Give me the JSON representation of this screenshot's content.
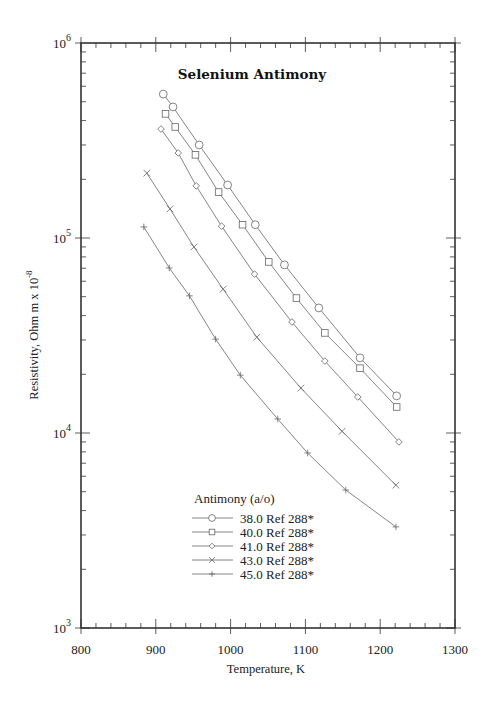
{
  "chart_data": {
    "type": "line",
    "title": "Selenium Antimony",
    "xlabel": "Temperature,  K",
    "ylabel": "Resistivity, Ohm m x 10",
    "ylabel_exponent": "-8",
    "xlim": [
      800,
      1300
    ],
    "ylim": [
      1000,
      1000000
    ],
    "yscale": "log",
    "x_ticks": [
      800,
      900,
      1000,
      1100,
      1200,
      1300
    ],
    "y_ticks": [
      {
        "base": "10",
        "exp": "3",
        "value": 1000
      },
      {
        "base": "10",
        "exp": "4",
        "value": 10000
      },
      {
        "base": "10",
        "exp": "5",
        "value": 100000
      },
      {
        "base": "10",
        "exp": "6",
        "value": 1000000
      }
    ],
    "grid": false,
    "legend_position": "lower-center",
    "legend_title": "Antimony (a/o)",
    "series": [
      {
        "name": "38.0 Ref 288*",
        "marker": "circle",
        "x": [
          910,
          923,
          958,
          996,
          1033,
          1072,
          1118,
          1173,
          1222
        ],
        "y": [
          547000,
          470000,
          300000,
          187000,
          117000,
          72800,
          43800,
          24300,
          15500
        ]
      },
      {
        "name": "40.0 Ref 288*",
        "marker": "square",
        "x": [
          913,
          926,
          953,
          984,
          1016,
          1051,
          1088,
          1126,
          1173,
          1222
        ],
        "y": [
          433000,
          371000,
          267000,
          172000,
          117000,
          75400,
          49200,
          32600,
          21500,
          13600
        ]
      },
      {
        "name": "41.0 Ref 288*",
        "marker": "diamond",
        "x": [
          907,
          930,
          954,
          988,
          1032,
          1082,
          1126,
          1170,
          1225
        ],
        "y": [
          362000,
          273000,
          185000,
          115000,
          65300,
          37100,
          23400,
          15300,
          9000
        ]
      },
      {
        "name": "43.0 Ref 288*",
        "marker": "x",
        "x": [
          888,
          919,
          951,
          990,
          1035,
          1094,
          1149,
          1221
        ],
        "y": [
          215000,
          141000,
          90000,
          54700,
          31000,
          17000,
          10200,
          5400
        ]
      },
      {
        "name": "45.0 Ref 288*",
        "marker": "plus",
        "x": [
          884,
          918,
          945,
          980,
          1013,
          1063,
          1103,
          1154,
          1221
        ],
        "y": [
          114000,
          70200,
          50500,
          30300,
          19800,
          11800,
          7900,
          5100,
          3300
        ]
      }
    ]
  },
  "colors": {
    "axis": "#333333",
    "series_line": "#777777",
    "marker": "#666666",
    "text": "#222222"
  }
}
